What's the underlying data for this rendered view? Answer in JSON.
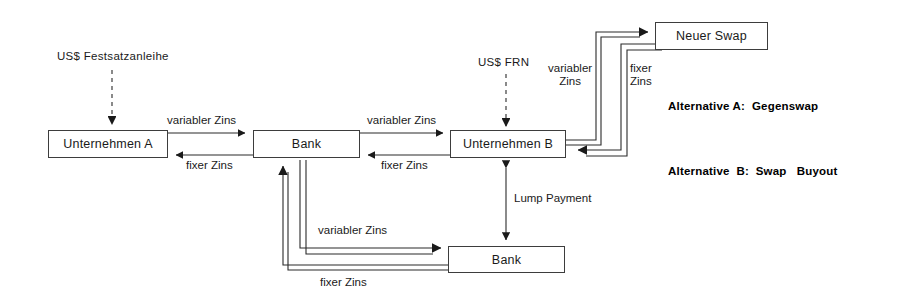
{
  "diagram": {
    "nodes": [
      {
        "id": "unternehmen_a",
        "label": "Unternehmen A"
      },
      {
        "id": "bank_top",
        "label": "Bank"
      },
      {
        "id": "unternehmen_b",
        "label": "Unternehmen B"
      },
      {
        "id": "neuer_swap",
        "label": "Neuer Swap"
      },
      {
        "id": "bank_bottom",
        "label": "Bank"
      }
    ],
    "sources": [
      {
        "id": "us_festsatzanleihe",
        "label": "US$ Festsatzanleihe"
      },
      {
        "id": "us_frn",
        "label": "US$ FRN"
      }
    ],
    "edge_labels": [
      {
        "id": "a_to_bank_variabel",
        "label": "variabler Zins"
      },
      {
        "id": "bank_to_a_fixer",
        "label": "fixer Zins"
      },
      {
        "id": "bank_to_b_variabel",
        "label": "variabler Zins"
      },
      {
        "id": "b_to_bank_fixer",
        "label": "fixer Zins"
      },
      {
        "id": "b_to_swap_variabel",
        "label": "variabler\nZins"
      },
      {
        "id": "swap_to_b_fixer",
        "label": "fixer\nZins"
      },
      {
        "id": "bottom_variabel",
        "label": "variabler Zins"
      },
      {
        "id": "bottom_fixer",
        "label": "fixer Zins"
      },
      {
        "id": "lump_payment",
        "label": "Lump Payment"
      }
    ],
    "alternatives": [
      {
        "id": "alternative_a",
        "label": "Alternative A:  Gegenswap"
      },
      {
        "id": "alternative_b",
        "label": "Alternative  B:  Swap   Buyout"
      }
    ],
    "colors": {
      "line": "#2b2b2b",
      "box_border": "#3d3d3d",
      "text": "#1a1a1a",
      "background": "#ffffff"
    }
  }
}
